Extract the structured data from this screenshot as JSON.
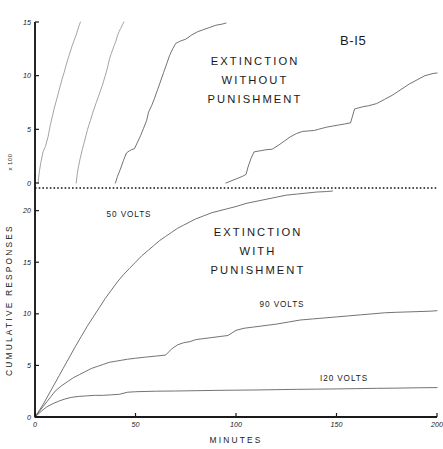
{
  "figure": {
    "subject_label": "B-I5",
    "xlabel": "MINUTES",
    "ylabel": "CUMULATIVE RESPONSES",
    "y_multiplier_note": "x 100"
  },
  "upper_panel": {
    "title_lines": [
      "EXTINCTION",
      "WITHOUT",
      "PUNISHMENT"
    ],
    "y_ticks": [
      "0",
      "5",
      "10",
      "15"
    ]
  },
  "lower_panel": {
    "title_lines": [
      "EXTINCTION",
      "WITH",
      "PUNISHMENT"
    ],
    "y_ticks": [
      "0",
      "5",
      "10",
      "15",
      "20"
    ],
    "series_labels": [
      "50 VOLTS",
      "90 VOLTS",
      "I20 VOLTS"
    ]
  },
  "x_ticks": [
    "0",
    "50",
    "100",
    "150",
    "200"
  ],
  "chart_data": {
    "type": "line",
    "xlabel": "MINUTES",
    "ylabel": "CUMULATIVE RESPONSES",
    "y_multiplier": 100,
    "grid": false,
    "legend": "inline-annotations",
    "panels": [
      {
        "name": "upper",
        "label_lines": [
          "EXTINCTION",
          "WITHOUT",
          "PUNISHMENT"
        ],
        "xlim": [
          0,
          200
        ],
        "ylim": [
          0,
          15
        ],
        "y_ticks": [
          0,
          5,
          10,
          15
        ],
        "direction": "up",
        "series": [
          {
            "name": "extinction-curve-1",
            "x": [
              1.5,
              2.2,
              3.0,
              4.0,
              5.2,
              6.5,
              7.5,
              8.5,
              9.5,
              10.5,
              11.5,
              12.5,
              13.5,
              14.5,
              15.5,
              16.5,
              17.5,
              18.5,
              19.5,
              20.5,
              21.3,
              22.0,
              22.6
            ],
            "y": [
              0.0,
              1.1,
              2.0,
              2.9,
              3.4,
              4.3,
              5.3,
              6.1,
              6.9,
              7.6,
              8.3,
              9.0,
              9.7,
              10.3,
              11.0,
              11.6,
              12.2,
              12.8,
              13.3,
              13.8,
              14.3,
              14.7,
              15.0
            ]
          },
          {
            "name": "extinction-curve-2",
            "x": [
              20.5,
              21.0,
              21.6,
              22.5,
              23.5,
              24.8,
              26.0,
              27.5,
              29.0,
              30.5,
              32.0,
              33.5,
              34.8,
              36.0,
              37.0,
              37.8,
              38.6,
              39.4,
              40.2,
              41.0,
              41.8,
              42.6,
              43.4,
              44.2
            ],
            "y": [
              0.0,
              0.8,
              1.5,
              2.3,
              3.1,
              4.0,
              4.9,
              5.8,
              6.7,
              7.5,
              8.3,
              9.1,
              9.9,
              10.7,
              11.5,
              12.0,
              12.4,
              12.8,
              13.2,
              13.7,
              14.1,
              14.4,
              14.7,
              15.0
            ]
          },
          {
            "name": "extinction-curve-3",
            "x": [
              40.0,
              41.0,
              42.5,
              44.0,
              45.5,
              47.0,
              48.0,
              49.5,
              51.0,
              52.5,
              54.0,
              55.5,
              56.5,
              58.0,
              59.5,
              61.0,
              62.5,
              64.0,
              65.5,
              67.0,
              68.5,
              70.0,
              72.0,
              75.0,
              78.0,
              81.0,
              84.0,
              87.0,
              90.0,
              93.0,
              95.0
            ],
            "y": [
              0.0,
              0.6,
              1.3,
              2.1,
              2.8,
              3.0,
              3.1,
              3.2,
              3.8,
              4.4,
              5.1,
              5.8,
              6.6,
              7.2,
              7.9,
              8.7,
              9.5,
              10.3,
              11.1,
              11.9,
              12.5,
              13.0,
              13.2,
              13.4,
              13.8,
              14.1,
              14.3,
              14.5,
              14.7,
              14.8,
              14.9
            ]
          },
          {
            "name": "extinction-curve-4",
            "x": [
              95.0,
              97.0,
              99.0,
              101.0,
              103.0,
              105.0,
              106.0,
              107.5,
              109.0,
              112.0,
              115.0,
              118.0,
              121.0,
              124.0,
              127.0,
              130.0,
              133.0,
              136.0,
              139.0,
              141.0,
              143.0,
              145.0,
              148.0,
              151.0,
              154.0,
              157.0,
              159.0,
              161.0,
              163.0,
              166.0,
              170.0,
              174.0,
              178.0,
              182.0,
              186.0,
              190.0,
              194.0,
              198.0,
              200.0
            ],
            "y": [
              0.0,
              0.15,
              0.3,
              0.45,
              0.6,
              0.8,
              1.5,
              2.3,
              2.9,
              3.0,
              3.1,
              3.15,
              3.5,
              3.9,
              4.3,
              4.6,
              4.8,
              4.85,
              4.9,
              5.0,
              5.1,
              5.2,
              5.3,
              5.4,
              5.5,
              5.6,
              6.9,
              7.0,
              7.1,
              7.2,
              7.4,
              7.8,
              8.2,
              8.7,
              9.2,
              9.6,
              10.0,
              10.2,
              10.25
            ]
          }
        ]
      },
      {
        "name": "lower",
        "label_lines": [
          "EXTINCTION",
          "WITH",
          "PUNISHMENT"
        ],
        "xlim": [
          0,
          200
        ],
        "ylim": [
          0,
          22
        ],
        "y_ticks": [
          0,
          5,
          10,
          15,
          20
        ],
        "direction": "down",
        "series": [
          {
            "name": "50-volts",
            "label": "50 VOLTS",
            "x": [
              0,
              2,
              4,
              6,
              8,
              10,
              12,
              14,
              16,
              18,
              20,
              23,
              26,
              29,
              32,
              35,
              38,
              41,
              44,
              47,
              50,
              53,
              56,
              59,
              62,
              65,
              68,
              71,
              74,
              77,
              80,
              84,
              88,
              92,
              96,
              100,
              105,
              110,
              115,
              120,
              125,
              130,
              135,
              140,
              145,
              148
            ],
            "y": [
              0.0,
              0.6,
              1.2,
              1.9,
              2.6,
              3.3,
              4.0,
              4.7,
              5.4,
              6.1,
              6.8,
              7.8,
              8.8,
              9.7,
              10.6,
              11.5,
              12.3,
              13.1,
              13.8,
              14.4,
              15.0,
              15.6,
              16.1,
              16.6,
              17.1,
              17.5,
              17.9,
              18.3,
              18.6,
              18.9,
              19.2,
              19.5,
              19.8,
              20.0,
              20.2,
              20.4,
              20.7,
              20.9,
              21.1,
              21.3,
              21.5,
              21.6,
              21.7,
              21.8,
              21.85,
              21.9
            ]
          },
          {
            "name": "90-volts",
            "label": "90 VOLTS",
            "x": [
              0,
              2,
              4,
              6,
              8,
              10,
              13,
              16,
              19,
              22,
              25,
              28,
              31,
              34,
              37,
              40,
              43,
              46,
              50,
              55,
              60,
              65,
              68,
              71,
              74,
              77,
              80,
              84,
              88,
              92,
              96,
              100,
              104,
              108,
              112,
              116,
              120,
              126,
              132,
              138,
              144,
              150,
              156,
              162,
              168,
              174,
              180,
              188,
              196,
              200
            ],
            "y": [
              0.0,
              0.5,
              1.0,
              1.5,
              2.0,
              2.5,
              3.0,
              3.4,
              3.8,
              4.1,
              4.4,
              4.7,
              4.9,
              5.1,
              5.3,
              5.4,
              5.5,
              5.6,
              5.7,
              5.8,
              5.9,
              6.0,
              6.6,
              7.0,
              7.2,
              7.3,
              7.5,
              7.6,
              7.7,
              7.8,
              7.9,
              8.4,
              8.6,
              8.7,
              8.8,
              8.9,
              9.0,
              9.2,
              9.4,
              9.5,
              9.6,
              9.7,
              9.8,
              9.9,
              10.0,
              10.1,
              10.15,
              10.2,
              10.25,
              10.3
            ]
          },
          {
            "name": "120-volts",
            "label": "I20 VOLTS",
            "x": [
              0,
              2,
              4,
              6,
              9,
              12,
              15,
              18,
              22,
              26,
              30,
              34,
              38,
              42,
              46,
              50,
              60,
              70,
              80,
              90,
              100,
              110,
              120,
              130,
              140,
              150,
              160,
              170,
              180,
              190,
              200
            ],
            "y": [
              0.0,
              0.35,
              0.7,
              1.0,
              1.3,
              1.55,
              1.75,
              1.9,
              2.0,
              2.05,
              2.1,
              2.1,
              2.15,
              2.2,
              2.4,
              2.45,
              2.5,
              2.52,
              2.55,
              2.58,
              2.6,
              2.62,
              2.65,
              2.68,
              2.7,
              2.72,
              2.75,
              2.78,
              2.8,
              2.83,
              2.85
            ]
          }
        ]
      }
    ]
  }
}
